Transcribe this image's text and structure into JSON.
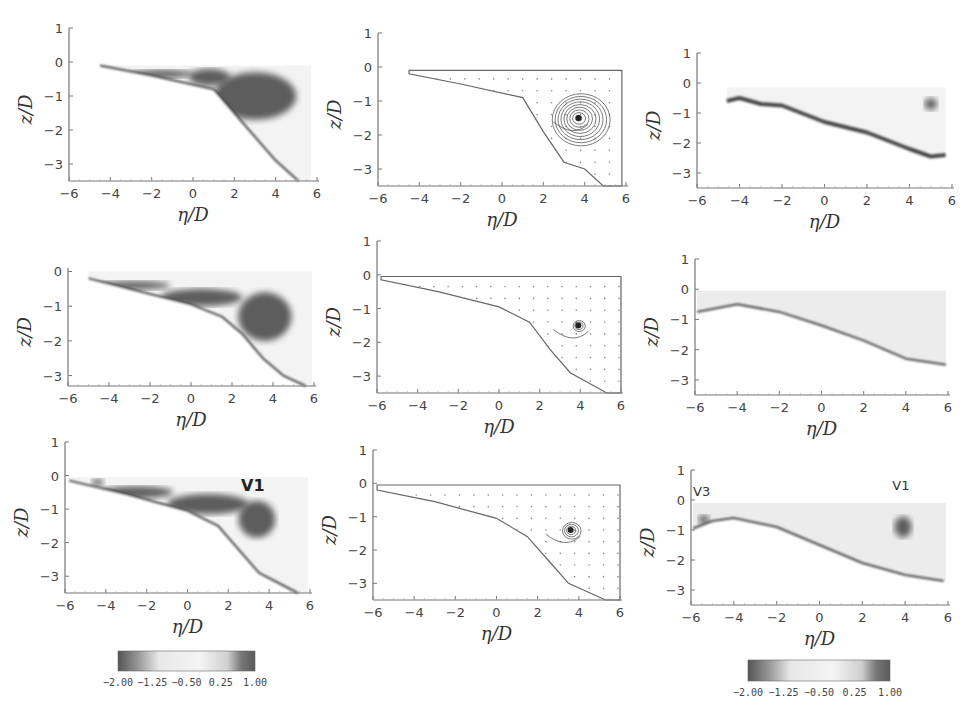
{
  "figure": {
    "width": 977,
    "height": 720,
    "colors": {
      "axis": "#777777",
      "dark": "#555555",
      "boundary": "#4a4a4a",
      "light": "#e6e6e6",
      "background": "#ffffff"
    }
  },
  "chart_data": [
    {
      "id": "r1c1",
      "type": "heatmap",
      "title": "",
      "xlabel": "η/D",
      "ylabel": "z/D",
      "xlim": [
        -6,
        6
      ],
      "ylim": [
        -3.5,
        1
      ],
      "xticks": [
        "−6",
        "−4",
        "−2",
        "0",
        "2",
        "4",
        "6"
      ],
      "yticks": [
        "1",
        "0",
        "−1",
        "−2",
        "−3"
      ],
      "box": {
        "x0": 69,
        "y0": 28,
        "x1": 317,
        "y1": 181
      },
      "boundary": [
        [
          -4.5,
          -0.1
        ],
        [
          -2,
          -0.4
        ],
        [
          1,
          -0.8
        ],
        [
          2,
          -1.5
        ],
        [
          3,
          -2.2
        ],
        [
          4,
          -2.9
        ],
        [
          5.1,
          -3.5
        ]
      ],
      "top": -0.1,
      "right": 5.7,
      "dark_regions": [
        {
          "cx": 3.0,
          "cy": -1.0,
          "rx": 2.0,
          "ry": 0.7
        },
        {
          "cx": 0.8,
          "cy": -0.45,
          "rx": 1.0,
          "ry": 0.25
        },
        {
          "cx": -1.5,
          "cy": -0.35,
          "rx": 1.5,
          "ry": 0.12
        }
      ],
      "annotations": []
    },
    {
      "id": "r1c2",
      "type": "streamline",
      "title": "",
      "xlabel": "η/D",
      "ylabel": "z/D",
      "xlim": [
        -6,
        6
      ],
      "ylim": [
        -3.5,
        1
      ],
      "xticks": [
        "−6",
        "−4",
        "−2",
        "0",
        "2",
        "4",
        "6"
      ],
      "yticks": [
        "1",
        "0",
        "−1",
        "−2",
        "−3"
      ],
      "box": {
        "x0": 378,
        "y0": 33,
        "x1": 626,
        "y1": 186
      },
      "boundary": [
        [
          -4.5,
          -0.2
        ],
        [
          -2,
          -0.5
        ],
        [
          1,
          -0.9
        ],
        [
          2,
          -1.9
        ],
        [
          3,
          -2.8
        ],
        [
          4,
          -3.0
        ],
        [
          4.9,
          -3.5
        ]
      ],
      "top": -0.1,
      "right": 5.8,
      "vortex": {
        "x": 3.7,
        "y": -1.5,
        "rings": 9,
        "rmax": 1.4
      },
      "annotations": []
    },
    {
      "id": "r1c3",
      "type": "heatmap",
      "title": "",
      "xlabel": "η/D",
      "ylabel": "z/D",
      "xlim": [
        -6,
        6
      ],
      "ylim": [
        -3.5,
        1
      ],
      "xticks": [
        "−6",
        "−4",
        "−2",
        "0",
        "2",
        "4",
        "6"
      ],
      "yticks": [
        "1",
        "0",
        "−1",
        "−2",
        "−3"
      ],
      "box": {
        "x0": 697,
        "y0": 53,
        "x1": 952,
        "y1": 188
      },
      "boundary": [
        [
          -4.6,
          -0.6
        ],
        [
          -4,
          -0.5
        ],
        [
          -3,
          -0.7
        ],
        [
          -2,
          -0.75
        ],
        [
          0,
          -1.3
        ],
        [
          2,
          -1.65
        ],
        [
          4,
          -2.2
        ],
        [
          5,
          -2.45
        ],
        [
          5.7,
          -2.4
        ]
      ],
      "top": -0.15,
      "right": 5.7,
      "dark_regions": [
        {
          "cx": 5.0,
          "cy": -0.7,
          "rx": 0.3,
          "ry": 0.2
        }
      ],
      "edge_dark": true,
      "annotations": []
    },
    {
      "id": "r2c1",
      "type": "heatmap",
      "title": "",
      "xlabel": "η/D",
      "ylabel": "z/D",
      "xlim": [
        -6,
        6
      ],
      "ylim": [
        -3.3,
        0.1
      ],
      "xticks": [
        "−6",
        "−4",
        "−2",
        "0",
        "2",
        "4",
        "6"
      ],
      "yticks": [
        "0",
        "−1",
        "−2",
        "−3"
      ],
      "box": {
        "x0": 68,
        "y0": 268,
        "x1": 314,
        "y1": 386
      },
      "boundary": [
        [
          -5,
          -0.2
        ],
        [
          -3,
          -0.5
        ],
        [
          0,
          -0.95
        ],
        [
          1.5,
          -1.3
        ],
        [
          2.5,
          -1.8
        ],
        [
          3.5,
          -2.5
        ],
        [
          4.5,
          -3.0
        ],
        [
          5.6,
          -3.3
        ]
      ],
      "top": 0,
      "right": 5.9,
      "dark_regions": [
        {
          "cx": 3.6,
          "cy": -1.3,
          "rx": 1.3,
          "ry": 0.7
        },
        {
          "cx": 0.5,
          "cy": -0.75,
          "rx": 2.0,
          "ry": 0.25
        },
        {
          "cx": -2.8,
          "cy": -0.4,
          "rx": 1.8,
          "ry": 0.12
        }
      ],
      "annotations": []
    },
    {
      "id": "r2c2",
      "type": "streamline",
      "title": "",
      "xlabel": "η/D",
      "ylabel": "z/D",
      "xlim": [
        -6,
        6
      ],
      "ylim": [
        -3.5,
        1
      ],
      "xticks": [
        "−6",
        "−4",
        "−2",
        "0",
        "2",
        "4",
        "6"
      ],
      "yticks": [
        "1",
        "0",
        "−1",
        "−2",
        "−3"
      ],
      "box": {
        "x0": 377,
        "y0": 241,
        "x1": 621,
        "y1": 393
      },
      "boundary": [
        [
          -5.8,
          -0.15
        ],
        [
          -3,
          -0.5
        ],
        [
          0,
          -0.95
        ],
        [
          1.5,
          -1.4
        ],
        [
          2.5,
          -2.2
        ],
        [
          3.5,
          -2.9
        ],
        [
          5.3,
          -3.5
        ]
      ],
      "top": -0.05,
      "right": 6.0,
      "vortex": {
        "x": 3.9,
        "y": -1.5,
        "rings": 3,
        "rmax": 0.3
      },
      "annotations": []
    },
    {
      "id": "r2c3",
      "type": "heatmap",
      "title": "",
      "xlabel": "η/D",
      "ylabel": "z/D",
      "xlim": [
        -6,
        6
      ],
      "ylim": [
        -3.5,
        1
      ],
      "xticks": [
        "−6",
        "−4",
        "−2",
        "0",
        "2",
        "4",
        "6"
      ],
      "yticks": [
        "1",
        "0",
        "−1",
        "−2",
        "−3"
      ],
      "box": {
        "x0": 695,
        "y0": 259,
        "x1": 948,
        "y1": 395
      },
      "boundary": [
        [
          -5.9,
          -0.75
        ],
        [
          -4,
          -0.5
        ],
        [
          -2,
          -0.75
        ],
        [
          0,
          -1.2
        ],
        [
          2,
          -1.7
        ],
        [
          4,
          -2.3
        ],
        [
          5.9,
          -2.5
        ]
      ],
      "top": -0.05,
      "right": 5.9,
      "dark_regions": [],
      "light_fill": true,
      "annotations": []
    },
    {
      "id": "r3c1",
      "type": "heatmap",
      "title": "",
      "xlabel": "η/D",
      "ylabel": "z/D",
      "xlim": [
        -6,
        6
      ],
      "ylim": [
        -3.5,
        1
      ],
      "xticks": [
        "−6",
        "−4",
        "−2",
        "0",
        "2",
        "4",
        "6"
      ],
      "yticks": [
        "1",
        "0",
        "−1",
        "−2",
        "−3"
      ],
      "box": {
        "x0": 65,
        "y0": 442,
        "x1": 310,
        "y1": 593
      },
      "boundary": [
        [
          -5.8,
          -0.15
        ],
        [
          -3,
          -0.55
        ],
        [
          0,
          -1.05
        ],
        [
          1.5,
          -1.5
        ],
        [
          2.5,
          -2.2
        ],
        [
          3.5,
          -2.9
        ],
        [
          5.4,
          -3.5
        ]
      ],
      "top": -0.05,
      "right": 5.9,
      "dark_regions": [
        {
          "cx": 3.4,
          "cy": -1.3,
          "rx": 0.9,
          "ry": 0.55
        },
        {
          "cx": 1.0,
          "cy": -0.85,
          "rx": 2.0,
          "ry": 0.3
        },
        {
          "cx": -2.5,
          "cy": -0.5,
          "rx": 1.8,
          "ry": 0.18
        },
        {
          "cx": -4.4,
          "cy": -0.2,
          "rx": 0.3,
          "ry": 0.1
        }
      ],
      "annotations": [
        {
          "text": "V1",
          "x": 3.2,
          "y": -0.45,
          "style": "bold"
        }
      ]
    },
    {
      "id": "r3c2",
      "type": "streamline",
      "title": "",
      "xlabel": "η/D",
      "ylabel": "z/D",
      "xlim": [
        -6,
        6
      ],
      "ylim": [
        -3.5,
        1
      ],
      "xticks": [
        "−6",
        "−4",
        "−2",
        "0",
        "2",
        "4",
        "6"
      ],
      "yticks": [
        "1",
        "0",
        "−1",
        "−2",
        "−3"
      ],
      "box": {
        "x0": 373,
        "y0": 450,
        "x1": 620,
        "y1": 600
      },
      "boundary": [
        [
          -5.8,
          -0.2
        ],
        [
          -3,
          -0.55
        ],
        [
          0,
          -1.05
        ],
        [
          1.5,
          -1.6
        ],
        [
          2.5,
          -2.3
        ],
        [
          3.5,
          -3.0
        ],
        [
          5.3,
          -3.5
        ]
      ],
      "top": -0.05,
      "right": 6.0,
      "vortex": {
        "x": 3.6,
        "y": -1.4,
        "rings": 4,
        "rmax": 0.45
      },
      "annotations": []
    },
    {
      "id": "r3c3",
      "type": "heatmap",
      "title": "",
      "xlabel": "η/D",
      "ylabel": "z/D",
      "xlim": [
        -6,
        6
      ],
      "ylim": [
        -3.5,
        1
      ],
      "xticks": [
        "−6",
        "−4",
        "−2",
        "0",
        "2",
        "4",
        "6"
      ],
      "yticks": [
        "1",
        "0",
        "−1",
        "−2",
        "−3"
      ],
      "box": {
        "x0": 691,
        "y0": 470,
        "x1": 948,
        "y1": 605
      },
      "boundary": [
        [
          -5.9,
          -0.95
        ],
        [
          -5,
          -0.7
        ],
        [
          -4,
          -0.6
        ],
        [
          -2,
          -0.9
        ],
        [
          0,
          -1.5
        ],
        [
          2,
          -2.1
        ],
        [
          4,
          -2.5
        ],
        [
          5.8,
          -2.7
        ]
      ],
      "top": -0.1,
      "right": 5.9,
      "dark_regions": [
        {
          "cx": -5.4,
          "cy": -0.65,
          "rx": 0.25,
          "ry": 0.15
        },
        {
          "cx": 3.9,
          "cy": -0.9,
          "rx": 0.4,
          "ry": 0.35
        }
      ],
      "light_fill": true,
      "annotations": [
        {
          "text": "V3",
          "x": -5.5,
          "y": 0.15,
          "style": "thin"
        },
        {
          "text": "V1",
          "x": 3.8,
          "y": 0.35,
          "style": "thin"
        }
      ]
    }
  ],
  "colorbars": [
    {
      "id": "colorbar-left",
      "x": 118,
      "y": 651,
      "width": 137,
      "height": 20,
      "ticks": [
        "−2.00",
        "−1.25",
        "−0.50",
        "0.25",
        "1.00"
      ]
    },
    {
      "id": "colorbar-right",
      "x": 748,
      "y": 660,
      "width": 142,
      "height": 21,
      "ticks": [
        "−2.00",
        "−1.25",
        "−0.50",
        "0.25",
        "1.00"
      ]
    }
  ]
}
